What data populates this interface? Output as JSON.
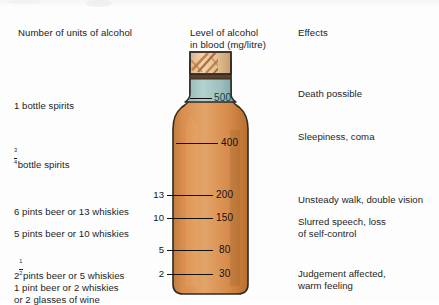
{
  "figure": {
    "title_artifact": "",
    "columns": {
      "units_header": "Number of units of alcohol",
      "level_header": "Level of alcohol\nin blood (mg/litre)",
      "effects_header": "Effects"
    }
  },
  "rows": [
    {
      "units_text": "1 bottle spirits",
      "units_fraction": null,
      "blood_level": "500",
      "unit_number": null,
      "effect": "Death possible"
    },
    {
      "units_text": "bottle spirits",
      "units_fraction": {
        "numerator": "3",
        "denominator": "4"
      },
      "blood_level": "400",
      "unit_number": null,
      "effect": "Sleepiness, coma"
    },
    {
      "units_text": "6 pints beer or 13 whiskies",
      "units_fraction": null,
      "blood_level": "200",
      "unit_number": "13",
      "effect": "Unsteady walk, double vision"
    },
    {
      "units_text": "5 pints beer or 10 whiskies",
      "units_fraction": null,
      "blood_level": "150",
      "unit_number": "10",
      "effect": "Slurred speech, loss\nof self-control"
    },
    {
      "units_text": "pints beer or 5 whiskies",
      "units_fraction": {
        "integer": "2",
        "numerator": "1",
        "denominator": "2"
      },
      "blood_level": "80",
      "unit_number": "5",
      "effect": ""
    },
    {
      "units_text": "1 pint beer or 2 whiskies\nor 2 glasses of wine",
      "units_fraction": null,
      "blood_level": "30",
      "unit_number": "2",
      "effect": "Judgement affected,\nwarm feeling"
    }
  ],
  "bottle": {
    "name": "spirits-bottle",
    "body_color": "#d4884a",
    "body_color_light": "#e2a266",
    "body_color_dark": "#b56a2e",
    "neck_color": "#a8c9c6",
    "neck_color_dark": "#7fa8a6",
    "cap_color": "#e8c9a0",
    "cap_band_color": "#6b4a30",
    "outline_color": "#2b2b2b"
  },
  "scale_values": [
    "500",
    "400",
    "200",
    "150",
    "80",
    "30"
  ],
  "unit_values": [
    "13",
    "10",
    "5",
    "2"
  ]
}
